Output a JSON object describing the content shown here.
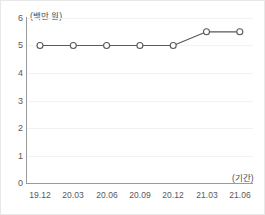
{
  "chart_data": {
    "type": "line",
    "title": "",
    "xlabel": "(기간)",
    "ylabel": "",
    "unit_label": "(백만 원)",
    "categories": [
      "19.12",
      "20.03",
      "20.06",
      "20.09",
      "20.12",
      "21.03",
      "21.06"
    ],
    "values": [
      5.0,
      5.0,
      5.0,
      5.0,
      5.0,
      5.5,
      5.5
    ],
    "series": [
      {
        "name": "",
        "values": [
          5.0,
          5.0,
          5.0,
          5.0,
          5.0,
          5.5,
          5.5
        ]
      }
    ],
    "ylim": [
      0,
      6
    ],
    "yticks": [
      "6",
      "5",
      "4",
      "3",
      "2",
      "1",
      "0"
    ],
    "ytick_values": [
      6,
      5,
      4,
      3,
      2,
      1,
      0
    ],
    "grid": true,
    "grid_axis": "y",
    "legend": "none",
    "marker": "open-circle",
    "colors": {
      "line": "#5a5a5e",
      "marker_fill": "#ffffff",
      "marker_stroke": "#5a5a5e",
      "axis": "#9a9a9a",
      "grid": "#f2f2f2",
      "text": "#58585a",
      "background": "#ffffff"
    }
  }
}
